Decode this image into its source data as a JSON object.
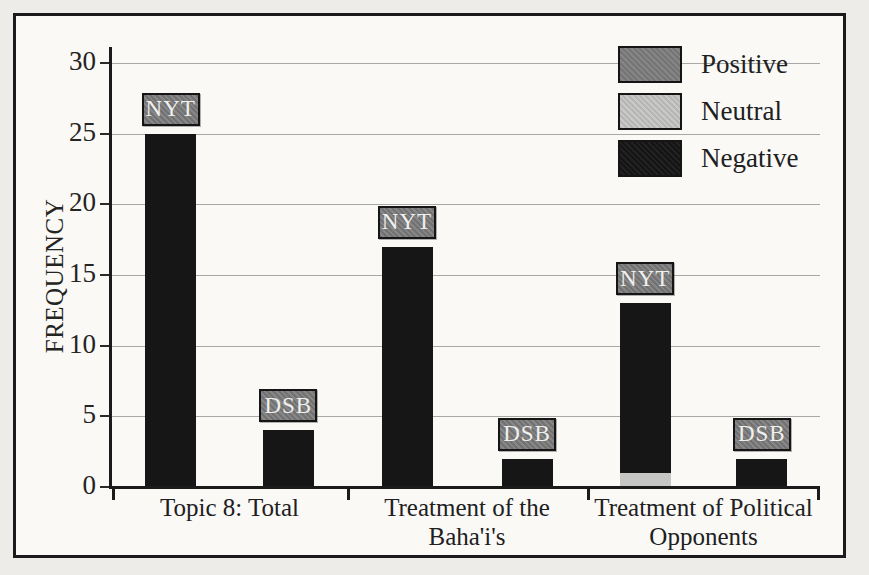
{
  "chart_data": {
    "type": "bar",
    "title": "",
    "xlabel": "",
    "ylabel": "FREQUENCY",
    "ylim": [
      0,
      30
    ],
    "yticks": [
      0,
      5,
      10,
      15,
      20,
      25,
      30
    ],
    "grid": "horizontal-gridlines-at-each-ytick",
    "legend": {
      "position": "top-right",
      "entries": [
        {
          "label": "Positive",
          "color": "#7f7f7f"
        },
        {
          "label": "Neutral",
          "color": "#c6c6c4"
        },
        {
          "label": "Negative",
          "color": "#161616"
        }
      ]
    },
    "categories": [
      "Topic 8: Total",
      "Treatment of the Baha'i's",
      "Treatment of Political Opponents"
    ],
    "groups": [
      {
        "category": "Topic 8: Total",
        "bars": [
          {
            "press": "NYT",
            "total": 25,
            "segments": [
              {
                "sentiment": "Negative",
                "value": 25
              }
            ]
          },
          {
            "press": "DSB",
            "total": 4,
            "segments": [
              {
                "sentiment": "Negative",
                "value": 4
              }
            ]
          }
        ]
      },
      {
        "category": "Treatment of the Baha'i's",
        "bars": [
          {
            "press": "NYT",
            "total": 17,
            "segments": [
              {
                "sentiment": "Negative",
                "value": 17
              }
            ]
          },
          {
            "press": "DSB",
            "total": 2,
            "segments": [
              {
                "sentiment": "Negative",
                "value": 2
              }
            ]
          }
        ]
      },
      {
        "category": "Treatment of Political Opponents",
        "bars": [
          {
            "press": "NYT",
            "total": 13,
            "segments": [
              {
                "sentiment": "Neutral",
                "value": 1
              },
              {
                "sentiment": "Negative",
                "value": 12
              }
            ]
          },
          {
            "press": "DSB",
            "total": 2,
            "segments": [
              {
                "sentiment": "Negative",
                "value": 2
              }
            ]
          }
        ]
      }
    ],
    "colors": {
      "Positive": "#7f7f7f",
      "Neutral": "#c6c6c4",
      "Negative": "#161616",
      "axis": "#1b1b1b",
      "gridline": "#a9a8a4",
      "frame_background": "#faf9f6",
      "page_background": "#edece8",
      "press_badge_background": "#7f7f7f"
    }
  }
}
